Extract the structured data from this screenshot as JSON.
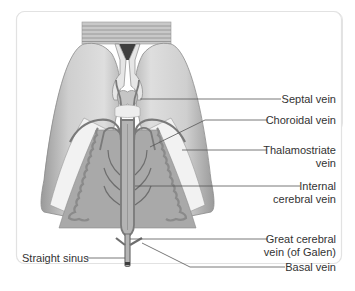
{
  "figure": {
    "type": "anatomical-diagram",
    "colors": {
      "background": "#ffffff",
      "panel_border": "#e3e3e3",
      "hemisphere_fill": "#c9c9c9",
      "vein": "#7a7a7a",
      "thalamus_fill": "#a5a5a5",
      "leader_line": "#555555",
      "label_text": "#333333"
    }
  },
  "labels": {
    "septal_vein": "Septal vein",
    "choroidal_vein": "Choroidal vein",
    "thalamostriate_vein_line1": "Thalamostriate",
    "thalamostriate_vein_line2": "vein",
    "internal_cerebral_vein_line1": "Internal",
    "internal_cerebral_vein_line2": "cerebral vein",
    "great_cerebral_vein_line1": "Great cerebral",
    "great_cerebral_vein_line2": "vein (of Galen)",
    "basal_vein": "Basal vein",
    "straight_sinus": "Straight sinus"
  }
}
